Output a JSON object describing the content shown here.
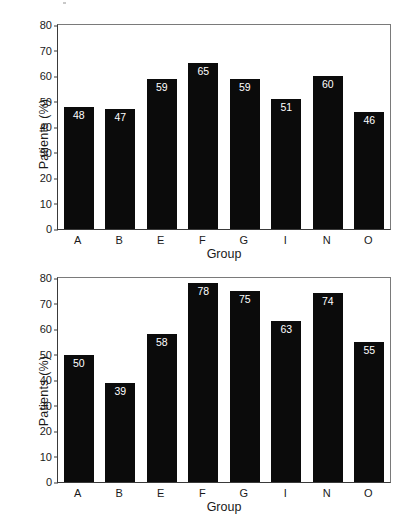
{
  "figure": {
    "background": "#ffffff",
    "bar_color": "#0b0b0b",
    "value_label_color": "#ffffff",
    "axis_color": "#3a3a3a"
  },
  "chart_data": [
    {
      "type": "bar",
      "id": "top",
      "title": "",
      "xlabel": "Group",
      "ylabel": "Patients (%)",
      "categories": [
        "A",
        "B",
        "E",
        "F",
        "G",
        "I",
        "N",
        "O"
      ],
      "values": [
        48,
        47,
        59,
        65,
        59,
        51,
        60,
        46
      ],
      "value_labels": [
        "48",
        "47",
        "59",
        "65",
        "59",
        "51",
        "60",
        "46"
      ],
      "ylim": [
        0,
        80
      ],
      "yticks": [
        0,
        10,
        20,
        30,
        40,
        50,
        60,
        70,
        80
      ],
      "ytick_labels": [
        "0",
        "10",
        "20",
        "30",
        "40",
        "50",
        "60",
        "70",
        "80"
      ],
      "grid": false,
      "legend": "none"
    },
    {
      "type": "bar",
      "id": "bottom",
      "title": "",
      "xlabel": "Group",
      "ylabel": "Patients (%)",
      "categories": [
        "A",
        "B",
        "E",
        "F",
        "G",
        "I",
        "N",
        "O"
      ],
      "values": [
        50,
        39,
        58,
        78,
        75,
        63,
        74,
        55
      ],
      "value_labels": [
        "50",
        "39",
        "58",
        "78",
        "75",
        "63",
        "74",
        "55"
      ],
      "ylim": [
        0,
        80
      ],
      "yticks": [
        0,
        10,
        20,
        30,
        40,
        50,
        60,
        70,
        80
      ],
      "ytick_labels": [
        "0",
        "10",
        "20",
        "30",
        "40",
        "50",
        "60",
        "70",
        "80"
      ],
      "grid": false,
      "legend": "none"
    }
  ]
}
